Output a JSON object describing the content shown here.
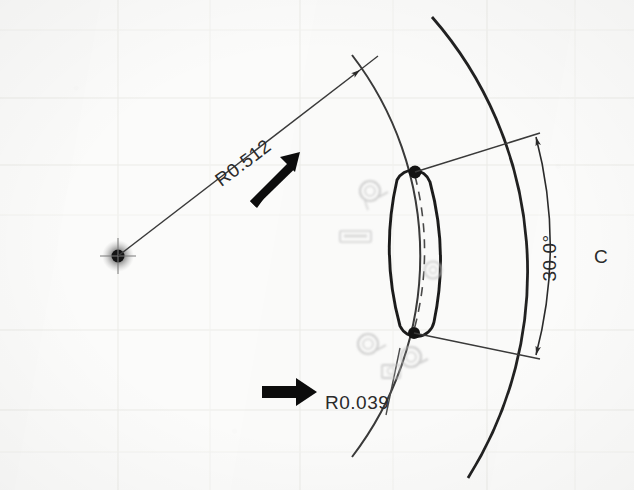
{
  "drawing": {
    "kind": "engineering-drawing-scan",
    "background_color": "#fbfbfa",
    "line_color": "#2b2b2b",
    "centerline_color": "#8d8d8d",
    "grid_color": "#e9e9e6",
    "ghost_color": "#c4c4c4",
    "annotation_arrow_color": "#111111"
  },
  "dimensions": {
    "radius_major": {
      "label": "R0.512",
      "rotation_deg": -45,
      "x": 247,
      "y": 168
    },
    "radius_minor": {
      "label": "R0.039",
      "rotation_deg": 0,
      "x": 325,
      "y": 403
    },
    "angle": {
      "label": "30.0°",
      "rotation_deg": -90,
      "x": 553,
      "y": 258
    },
    "centerline_symbol": {
      "label": "C",
      "x": 598,
      "y": 257
    }
  },
  "ghost_marks": [
    {
      "name": "ghost-circle-upper-left",
      "x": 370,
      "y": 191,
      "r": 11
    },
    {
      "name": "ghost-box-centerline",
      "x": 355,
      "y": 237,
      "w": 30,
      "h": 11
    },
    {
      "name": "ghost-circle-middle",
      "x": 433,
      "y": 270,
      "r": 9
    },
    {
      "name": "ghost-circle-lower-left",
      "x": 368,
      "y": 344,
      "r": 11
    },
    {
      "name": "ghost-circle-lower-right",
      "x": 411,
      "y": 357,
      "r": 11
    },
    {
      "name": "ghost-box-lower",
      "x": 391,
      "y": 371,
      "w": 18,
      "h": 13
    }
  ],
  "geometry": {
    "arc_center": {
      "x": 118,
      "y": 256
    },
    "slot_endpoint_top": {
      "x": 415,
      "y": 172
    },
    "slot_endpoint_bottom": {
      "x": 414,
      "y": 333
    },
    "radial_arrow_tip": {
      "x": 362,
      "y": 68
    },
    "angle_arrow_top": {
      "x": 536,
      "y": 136
    },
    "angle_arrow_bottom": {
      "x": 536,
      "y": 356
    }
  },
  "callout_arrows": [
    {
      "name": "callout-arrow-radius-major",
      "from_x": 252,
      "from_y": 199,
      "to_x": 292,
      "to_y": 160
    },
    {
      "name": "callout-arrow-radius-minor",
      "from_x": 262,
      "from_y": 392,
      "to_x": 318,
      "to_y": 392
    }
  ]
}
